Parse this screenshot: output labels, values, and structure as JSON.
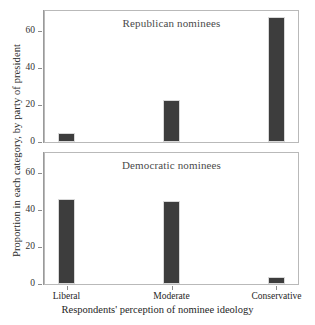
{
  "chart_data": {
    "type": "bar",
    "title": "",
    "xlabel": "Respondents' perception of nominee ideology",
    "ylabel": "Proportion in each category, by party of president",
    "categories": [
      "Liberal",
      "Moderate",
      "Conservative"
    ],
    "ylim": [
      0,
      71
    ],
    "yticks": [
      0,
      20,
      40,
      60
    ],
    "ytick_labels": [
      "0",
      "20",
      "40",
      "60"
    ],
    "grid": false,
    "legend": "none",
    "bar_color": "#3d3d3d",
    "panels": [
      {
        "title": "Republican nominees",
        "values": [
          5,
          23,
          68
        ]
      },
      {
        "title": "Democratic nominees",
        "values": [
          46,
          45,
          4
        ]
      }
    ],
    "series": [
      {
        "name": "Republican nominees",
        "values": [
          5,
          23,
          68
        ]
      },
      {
        "name": "Democratic nominees",
        "values": [
          46,
          45,
          4
        ]
      }
    ]
  }
}
